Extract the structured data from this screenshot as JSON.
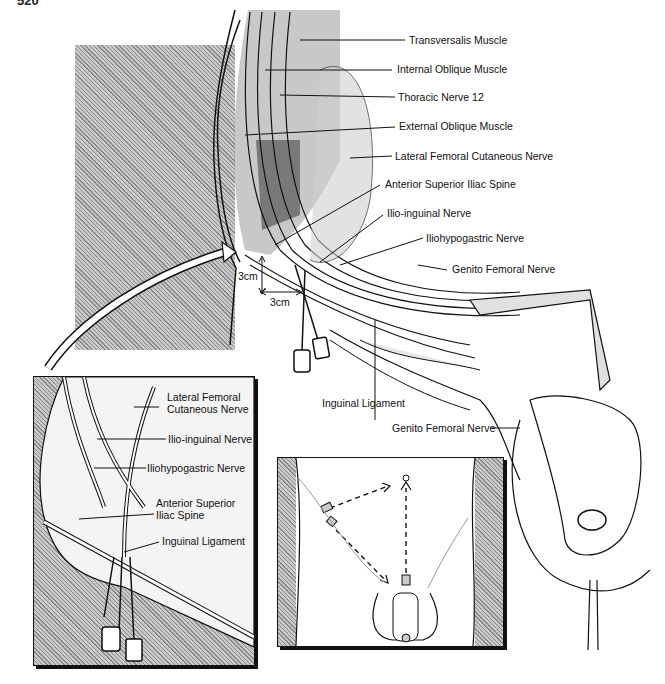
{
  "page": {
    "number": "520"
  },
  "main_figure": {
    "labels": [
      {
        "id": "transversalis",
        "text": "Transversalis Muscle"
      },
      {
        "id": "internal-oblique",
        "text": "Internal Oblique Muscle"
      },
      {
        "id": "thoracic-12",
        "text": "Thoracic Nerve 12"
      },
      {
        "id": "external-oblique",
        "text": "External Oblique Muscle"
      },
      {
        "id": "lat-fem-cut",
        "text": "Lateral Femoral Cutaneous Nerve"
      },
      {
        "id": "asis",
        "text": "Anterior Superior  Iliac Spine"
      },
      {
        "id": "ilio-inguinal",
        "text": "Ilio-inguinal Nerve"
      },
      {
        "id": "iliohypogastric",
        "text": "Iliohypogastric Nerve"
      },
      {
        "id": "genito-femoral-upper",
        "text": "Genito Femoral Nerve"
      },
      {
        "id": "inguinal-ligament",
        "text": "Inguinal Ligament"
      },
      {
        "id": "genito-femoral-lower",
        "text": "Genito Femoral Nerve"
      }
    ],
    "measurements": {
      "vertical": "3cm",
      "horizontal": "3cm"
    }
  },
  "inset_left": {
    "labels": [
      {
        "id": "lat-fem-cut",
        "text": "Lateral Femoral Cutaneous Nerve"
      },
      {
        "id": "ilio-inguinal",
        "text": "Ilio-inguinal Nerve"
      },
      {
        "id": "iliohypogastric",
        "text": "Iliohypogastric Nerve"
      },
      {
        "id": "asis",
        "text": "Anterior Superior Iliac Spine"
      },
      {
        "id": "inguinal-ligament",
        "text": "Inguinal Ligament"
      }
    ]
  },
  "inset_right": {
    "description": "Needle insertion sites with dashed arrows on lower abdomen"
  }
}
